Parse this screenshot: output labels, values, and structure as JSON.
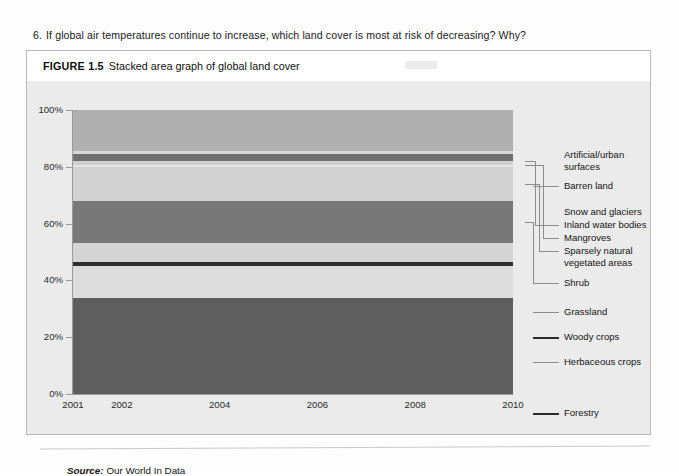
{
  "question": {
    "number": "6.",
    "text": "If global air temperatures continue to increase, which land cover is most at risk of decreasing? Why?"
  },
  "figure": {
    "label": "FIGURE 1.5",
    "title": "Stacked area graph of global land cover",
    "source_label": "Source:",
    "source_text": "Our World In Data"
  },
  "chart_data": {
    "type": "area",
    "title": "Stacked area graph of global land cover",
    "xlabel": "",
    "ylabel": "",
    "ylim": [
      0,
      100
    ],
    "ytick_labels": [
      "0%",
      "20%",
      "40%",
      "60%",
      "80%",
      "100%"
    ],
    "ytick_values": [
      0,
      20,
      40,
      60,
      80,
      100
    ],
    "xtick_labels": [
      "2001",
      "2002",
      "2004",
      "2006",
      "2008",
      "2010"
    ],
    "xtick_values": [
      2001,
      2002,
      2004,
      2006,
      2008,
      2010
    ],
    "xlim": [
      2001,
      2010
    ],
    "grid": false,
    "legend_position": "right",
    "stack_order": "top-to-bottom",
    "series": [
      {
        "name": "Artificial/urban surfaces",
        "share": 14.5,
        "top": 100.0,
        "bottom": 85.5,
        "color": "#b0b0b0"
      },
      {
        "name": "Barren land",
        "share": 1.0,
        "top": 85.5,
        "bottom": 84.5,
        "color": "#d9d9d9"
      },
      {
        "name": "Snow and glaciers",
        "share": 2.6,
        "top": 84.5,
        "bottom": 81.9,
        "color": "#6f6f6f"
      },
      {
        "name": "Inland water bodies",
        "share": 1.1,
        "top": 81.9,
        "bottom": 80.8,
        "color": "#cfcfcf"
      },
      {
        "name": "Mangroves",
        "share": 0.8,
        "top": 80.8,
        "bottom": 80.0,
        "color": "#e4e4e4"
      },
      {
        "name": "Sparsely natural vegetated areas",
        "share": 12.0,
        "top": 80.0,
        "bottom": 68.0,
        "color": "#d2d2d2"
      },
      {
        "name": "Shrub",
        "share": 15.0,
        "top": 68.0,
        "bottom": 53.0,
        "color": "#787878"
      },
      {
        "name": "Grassland",
        "share": 6.6,
        "top": 53.0,
        "bottom": 46.4,
        "color": "#d4d4d4"
      },
      {
        "name": "Woody crops",
        "share": 1.5,
        "top": 46.4,
        "bottom": 44.9,
        "color": "#2e2e2e"
      },
      {
        "name": "Herbaceous crops",
        "share": 11.0,
        "top": 44.9,
        "bottom": 33.9,
        "color": "#dcdcdc"
      },
      {
        "name": "Forestry",
        "share": 33.9,
        "top": 33.9,
        "bottom": 0.0,
        "color": "#5e5e5e"
      }
    ]
  },
  "legend": {
    "entries": [
      {
        "label": "Artificial/urban\nsurfaces"
      },
      {
        "label": "Barren land"
      },
      {
        "label": "Snow and glaciers"
      },
      {
        "label": "Inland water bodies"
      },
      {
        "label": "Mangroves"
      },
      {
        "label": "Sparsely natural\nvegetated areas"
      },
      {
        "label": "Shrub"
      },
      {
        "label": "Grassland"
      },
      {
        "label": "Woody crops"
      },
      {
        "label": "Herbaceous crops"
      },
      {
        "label": "Forestry"
      }
    ]
  },
  "colors": {
    "figure_background": "#ebebeb",
    "caption_background": "#ffffff",
    "figure_border": "#b9b9b9",
    "axis": "#9a9a9a",
    "text": "#141414"
  }
}
